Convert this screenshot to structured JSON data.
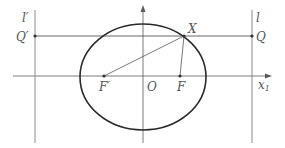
{
  "figure": {
    "colors": {
      "ellipse": "#2a2a2a",
      "axes": "#5a5a5a",
      "directrix": "#8a8a8a",
      "segment": "#555555",
      "label": "#555555"
    },
    "labels": {
      "l_prime": "l′",
      "l": "l",
      "Q_prime": "Q′",
      "Q": "Q",
      "X": "X",
      "F_prime": "F′",
      "O": "O",
      "F": "F",
      "x_axis": "x",
      "x_axis_sub": "1"
    },
    "geometry": {
      "center": [
        143,
        76
      ],
      "rx": 63,
      "ry": 53,
      "focus_F": [
        180,
        76
      ],
      "focus_F_prime": [
        104,
        76
      ],
      "point_X": [
        184,
        36
      ],
      "point_Q": [
        252,
        36
      ],
      "point_Q_prime": [
        35,
        36
      ],
      "directrix_l_x": 252,
      "directrix_l_prime_x": 35
    }
  }
}
